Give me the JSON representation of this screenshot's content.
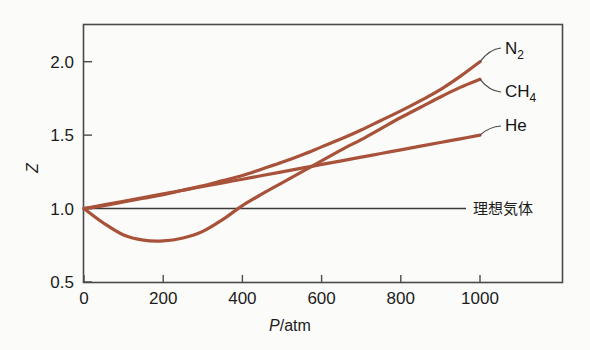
{
  "chart_data": {
    "type": "line",
    "title": "",
    "xlabel": "P/atm",
    "ylabel": "Z",
    "xlim": [
      0,
      1000
    ],
    "ylim": [
      0.5,
      2.25
    ],
    "xticks": [
      0,
      200,
      400,
      600,
      800,
      1000
    ],
    "xtick_labels": [
      "0",
      "200",
      "400",
      "600",
      "800",
      "1000"
    ],
    "yticks": [
      0.5,
      1.0,
      1.5,
      2.0
    ],
    "ytick_labels": [
      "0.5",
      "1.0",
      "1.5",
      "2.0"
    ],
    "grid": false,
    "legend_position": "right-inline-labels",
    "series_color": "#a8523a",
    "reference_line_color": "#3a3a3a",
    "series": [
      {
        "name": "N2",
        "label_main": "N",
        "label_sub": "2",
        "x": [
          0,
          50,
          100,
          150,
          200,
          250,
          300,
          350,
          400,
          450,
          500,
          550,
          600,
          650,
          700,
          750,
          800,
          850,
          900,
          950,
          1000
        ],
        "values": [
          1.0,
          1.02,
          1.045,
          1.07,
          1.095,
          1.125,
          1.155,
          1.19,
          1.225,
          1.27,
          1.315,
          1.365,
          1.42,
          1.475,
          1.535,
          1.6,
          1.665,
          1.735,
          1.81,
          1.9,
          2.0
        ]
      },
      {
        "name": "CH4",
        "label_main": "CH",
        "label_sub": "4",
        "x": [
          0,
          50,
          100,
          150,
          200,
          250,
          300,
          350,
          400,
          450,
          500,
          550,
          600,
          650,
          700,
          750,
          800,
          850,
          900,
          950,
          1000
        ],
        "values": [
          1.0,
          0.9,
          0.82,
          0.785,
          0.78,
          0.8,
          0.845,
          0.925,
          1.02,
          1.1,
          1.175,
          1.25,
          1.325,
          1.4,
          1.47,
          1.545,
          1.62,
          1.69,
          1.76,
          1.825,
          1.88
        ]
      },
      {
        "name": "He",
        "label_main": "He",
        "label_sub": "",
        "x": [
          0,
          50,
          100,
          150,
          200,
          250,
          300,
          350,
          400,
          450,
          500,
          550,
          600,
          650,
          700,
          750,
          800,
          850,
          900,
          950,
          1000
        ],
        "values": [
          1.0,
          1.025,
          1.05,
          1.075,
          1.1,
          1.125,
          1.15,
          1.175,
          1.2,
          1.225,
          1.25,
          1.275,
          1.3,
          1.325,
          1.35,
          1.375,
          1.4,
          1.425,
          1.45,
          1.475,
          1.5
        ]
      }
    ],
    "reference_line": {
      "name": "ideal-gas",
      "label": "理想気体",
      "y_value": 1.0,
      "x_from": 0,
      "x_to": 1000
    },
    "annotations": [
      {
        "name": "n2-label",
        "text": "N2"
      },
      {
        "name": "ch4-label",
        "text": "CH4"
      },
      {
        "name": "he-label",
        "text": "He"
      },
      {
        "name": "ideal-gas-label",
        "text": "理想気体"
      }
    ]
  }
}
